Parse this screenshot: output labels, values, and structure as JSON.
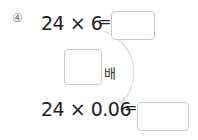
{
  "problem": {
    "number": "④",
    "line1": {
      "left": "24 × 6",
      "equals": "="
    },
    "middle": {
      "unit": "배"
    },
    "line2": {
      "left": "24 × 0.06",
      "equals": "="
    }
  }
}
